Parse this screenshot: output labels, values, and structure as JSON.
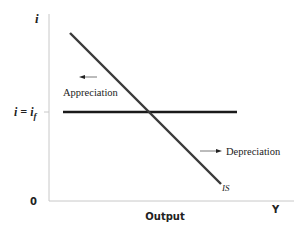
{
  "diagram": {
    "type": "economics-line-diagram",
    "axes": {
      "y_label": "i",
      "x_label": "Y",
      "x_title": "Output",
      "origin_label": "0",
      "y_tick_label": "i = i",
      "y_tick_subscript": "f"
    },
    "curves": {
      "is_label": "IS",
      "horizontal_line": "interest parity line i = i_f"
    },
    "annotations": {
      "appreciation": "Appreciation",
      "depreciation": "Depreciation"
    },
    "colors": {
      "line": "#2b2b2b",
      "axis": "#c8c8c8",
      "text": "#222222"
    }
  }
}
